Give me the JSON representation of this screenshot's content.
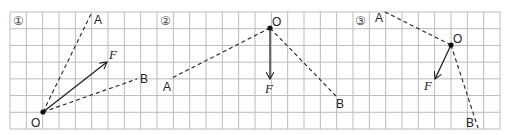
{
  "grid": {
    "x0": 10,
    "y0": 12,
    "x1": 500,
    "y1": 129,
    "cols": 30,
    "rows": 7,
    "color": "#bbbbbb"
  },
  "panels": [
    {
      "number": "①",
      "num_pos": [
        13,
        25
      ],
      "O": {
        "label": "O",
        "pos": [
          43,
          112
        ],
        "label_pos": [
          31,
          127
        ]
      },
      "A": {
        "label": "A",
        "pos": [
          92,
          12
        ],
        "label_pos": [
          94,
          24
        ]
      },
      "B": {
        "label": "B",
        "pos": [
          137,
          79
        ],
        "label_pos": [
          140,
          83
        ]
      },
      "F": {
        "label": "F",
        "tip": [
          107,
          62
        ],
        "label_pos": [
          109,
          59
        ]
      }
    },
    {
      "number": "②",
      "num_pos": [
        160,
        25
      ],
      "O": {
        "label": "O",
        "pos": [
          270,
          28
        ],
        "label_pos": [
          272,
          26
        ]
      },
      "A": {
        "label": "A",
        "pos": [
          170,
          79
        ],
        "label_pos": [
          163,
          91
        ]
      },
      "B": {
        "label": "B",
        "pos": [
          336,
          96
        ],
        "label_pos": [
          336,
          108
        ]
      },
      "F": {
        "label": "F",
        "tip": [
          270,
          79
        ],
        "label_pos": [
          265,
          93
        ]
      }
    },
    {
      "number": "③",
      "num_pos": [
        355,
        25
      ],
      "O": {
        "label": "O",
        "pos": [
          451,
          45
        ],
        "label_pos": [
          453,
          43
        ]
      },
      "A": {
        "label": "A",
        "pos": [
          385,
          12
        ],
        "label_pos": [
          375,
          22
        ]
      },
      "B": {
        "label": "B",
        "pos": [
          478,
          128
        ],
        "label_pos": [
          466,
          127
        ]
      },
      "F": {
        "label": "F",
        "tip": [
          435,
          79
        ],
        "label_pos": [
          424,
          90
        ]
      }
    }
  ]
}
